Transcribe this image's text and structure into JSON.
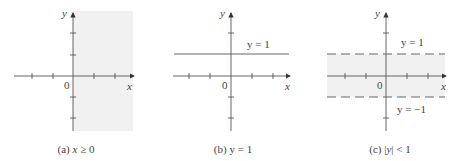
{
  "colors": {
    "axis": "#555555",
    "shade": "#f1f1f1",
    "text": "#444444"
  },
  "panels": [
    {
      "id": "a",
      "caption": {
        "prefix": "(a) ",
        "math": "x",
        "rel": " ≥ 0"
      },
      "axis_labels": {
        "x": "x",
        "y": "y",
        "origin": "0"
      },
      "region": "x >= 0",
      "lines": []
    },
    {
      "id": "b",
      "caption": {
        "prefix": "(b) ",
        "math": "",
        "rel": "y = 1"
      },
      "axis_labels": {
        "x": "x",
        "y": "y",
        "origin": "0"
      },
      "region": "none",
      "lines": [
        {
          "label": "y = 1",
          "style": "solid"
        }
      ]
    },
    {
      "id": "c",
      "caption": {
        "prefix": "(c) |",
        "math": "y",
        "rel": "| < 1"
      },
      "axis_labels": {
        "x": "x",
        "y": "y",
        "origin": "0"
      },
      "region": "|y| < 1",
      "lines": [
        {
          "label": "y = 1",
          "style": "dashed"
        },
        {
          "label": "y = −1",
          "style": "dashed"
        }
      ]
    }
  ]
}
